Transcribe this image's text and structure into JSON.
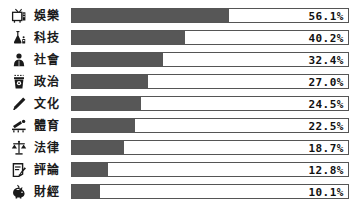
{
  "chart_data": {
    "type": "bar",
    "orientation": "horizontal",
    "title": "",
    "subtitle": "",
    "xlabel": "",
    "ylabel": "",
    "xlim": [
      0,
      100
    ],
    "grid": false,
    "legend": null,
    "value_suffix": "%",
    "categories": [
      "娛樂",
      "科技",
      "社會",
      "政治",
      "文化",
      "體育",
      "法律",
      "評論",
      "財經"
    ],
    "values": [
      56.1,
      40.2,
      32.4,
      27.0,
      24.5,
      22.5,
      18.7,
      12.8,
      10.1
    ],
    "value_labels": [
      "56.1%",
      "40.2%",
      "32.4%",
      "27.0%",
      "24.5%",
      "22.5%",
      "18.7%",
      "12.8%",
      "10.1%"
    ],
    "icons": [
      "tv-icon",
      "science-flask-icon",
      "person-icon",
      "ballot-box-icon",
      "pen-icon",
      "sports-icon",
      "scales-icon",
      "clipboard-icon",
      "piggy-bank-icon"
    ],
    "colors": {
      "bar_fill": "#575757",
      "bar_track": "#ffffff",
      "bar_border": "#555555",
      "text": "#1a1a1a",
      "background": "#ffffff"
    }
  }
}
